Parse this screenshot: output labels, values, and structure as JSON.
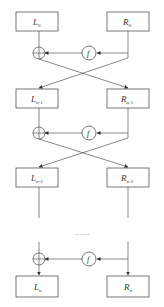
{
  "diagram": {
    "type": "feistel-network",
    "rounds": [
      {
        "left": {
          "main": "L",
          "sub": "0"
        },
        "right": {
          "main": "R",
          "sub": "0"
        }
      },
      {
        "left": {
          "main": "L",
          "sub": "n-1"
        },
        "right": {
          "main": "R",
          "sub": "n-1"
        }
      },
      {
        "left": {
          "main": "L",
          "sub": "n-2"
        },
        "right": {
          "main": "R",
          "sub": "n-2"
        }
      },
      {
        "left": {
          "main": "L",
          "sub": "n"
        },
        "right": {
          "main": "R",
          "sub": "n"
        }
      }
    ],
    "function_label": "f",
    "ellipsis": "……",
    "colors": {
      "stroke": "#555555",
      "text": "#333333",
      "background": "#ffffff"
    }
  }
}
